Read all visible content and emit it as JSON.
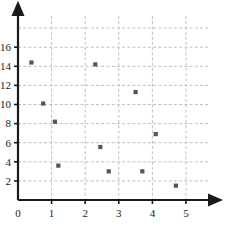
{
  "chart_data": {
    "type": "scatter",
    "title": "",
    "xlabel": "",
    "ylabel": "",
    "xlim": [
      0,
      5.8
    ],
    "ylim": [
      0,
      17.2
    ],
    "xticks": [
      0,
      1,
      2,
      3,
      4,
      5
    ],
    "yticks": [
      2,
      4,
      6,
      8,
      10,
      12,
      14,
      16
    ],
    "xtick_labels": [
      "0",
      "1",
      "2",
      "3",
      "4",
      "5"
    ],
    "ytick_labels": [
      "2",
      "4",
      "6",
      "8",
      "10",
      "12",
      "14",
      "16"
    ],
    "grid": true,
    "grid_style": "dashed",
    "grid_color": "#bfbfbf",
    "axis_color": "#1a1a1a",
    "marker_color": "#555555",
    "marker_shape": "square",
    "legend": null,
    "series": [
      {
        "name": "points",
        "points": [
          {
            "x": 0.4,
            "y": 14.4
          },
          {
            "x": 0.75,
            "y": 10.1
          },
          {
            "x": 1.1,
            "y": 8.2
          },
          {
            "x": 1.2,
            "y": 3.6
          },
          {
            "x": 2.3,
            "y": 14.2
          },
          {
            "x": 2.45,
            "y": 5.55
          },
          {
            "x": 2.7,
            "y": 3.0
          },
          {
            "x": 3.5,
            "y": 11.3
          },
          {
            "x": 3.7,
            "y": 3.0
          },
          {
            "x": 4.1,
            "y": 6.9
          },
          {
            "x": 4.7,
            "y": 1.5
          }
        ]
      }
    ]
  },
  "axes": {
    "x_axis_name": "x-axis",
    "y_axis_name": "y-axis"
  }
}
